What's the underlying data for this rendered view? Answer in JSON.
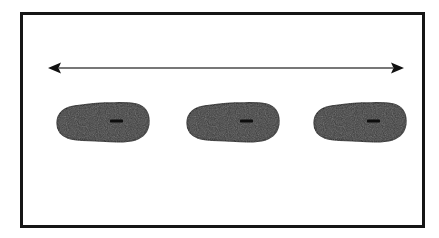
{
  "figure": {
    "type": "scientific-diagram",
    "caption": "",
    "background_color": "#ffffff",
    "width": 439,
    "height": 238
  },
  "frame": {
    "name": "figure-border",
    "x": 20,
    "y": 12,
    "width": 405,
    "height": 216,
    "stroke_color": "#161616",
    "stroke_width": 3,
    "fill": "#ffffff"
  },
  "arrow": {
    "name": "double-headed-span-arrow",
    "label": "",
    "orientation": "horizontal",
    "direction": "both",
    "x_start": 48,
    "x_end": 404,
    "y": 68,
    "line_color": "#4a4a4a",
    "line_width": 1.6,
    "head_color": "#111111",
    "head_length": 13,
    "head_half_width": 5.5
  },
  "blobs": [
    {
      "name": "blob-1",
      "index": 1,
      "center_x": 103,
      "center_y": 122,
      "width": 92,
      "height": 40,
      "fill_color": "#3c3c3c",
      "stroke_color": "#1c1c1c",
      "marker": {
        "name": "blob-1-marker",
        "x": 110,
        "y": 121,
        "width": 13,
        "height": 3,
        "color": "#0d0d0d"
      }
    },
    {
      "name": "blob-2",
      "index": 2,
      "center_x": 233,
      "center_y": 122,
      "width": 92,
      "height": 40,
      "fill_color": "#3c3c3c",
      "stroke_color": "#1c1c1c",
      "marker": {
        "name": "blob-2-marker",
        "x": 240,
        "y": 121,
        "width": 13,
        "height": 3,
        "color": "#0d0d0d"
      }
    },
    {
      "name": "blob-3",
      "index": 3,
      "center_x": 360,
      "center_y": 122,
      "width": 92,
      "height": 40,
      "fill_color": "#3c3c3c",
      "stroke_color": "#1c1c1c",
      "marker": {
        "name": "blob-3-marker",
        "x": 367,
        "y": 121,
        "width": 13,
        "height": 3,
        "color": "#0d0d0d"
      }
    }
  ],
  "colors": {
    "background": "#ffffff",
    "frame_stroke": "#161616",
    "blob_fill": "#3c3c3c",
    "blob_stroke": "#1c1c1c",
    "arrow_line": "#4a4a4a",
    "arrow_head": "#111111",
    "marker": "#0d0d0d"
  }
}
